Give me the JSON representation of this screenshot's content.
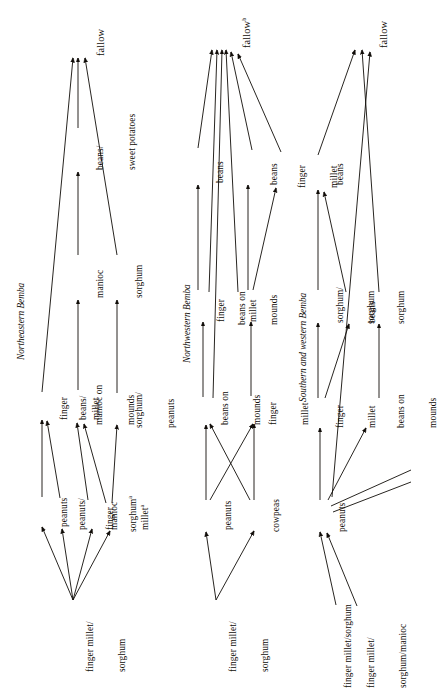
{
  "figure": {
    "type": "diagram",
    "orientation": "text rotated 90 degrees counter-clockwise",
    "background_color": "#ffffff",
    "ink_color": "#100c08"
  },
  "sections": [
    {
      "id": "northeastern",
      "title": "Northeastern Bemba",
      "nodes": [
        {
          "id": "ne-src",
          "label": "finger millet/\nsorghum"
        },
        {
          "id": "ne-peanuts",
          "label": "peanuts"
        },
        {
          "id": "ne-pean-man",
          "label": "peanuts/\nmanioc"
        },
        {
          "id": "ne-fm-a",
          "label": "finger\nmillet",
          "note": "a"
        },
        {
          "id": "ne-sorg-a",
          "label": "sorghum",
          "note": "a"
        },
        {
          "id": "ne-fmillet",
          "label": "finger\nmillet"
        },
        {
          "id": "ne-beans",
          "label": "beans/"
        },
        {
          "id": "ne-manioc-m",
          "label": "manioc on\nmounds"
        },
        {
          "id": "ne-sorg-pean",
          "label": "sorghum/\npeanuts"
        },
        {
          "id": "ne-manioc",
          "label": "manioc"
        },
        {
          "id": "ne-sorghum",
          "label": "sorghum"
        },
        {
          "id": "ne-beans-sp",
          "label": "beans/\nsweet potatoes"
        },
        {
          "id": "ne-fallow",
          "label": "fallow"
        }
      ],
      "edges": [
        [
          "ne-src",
          "ne-peanuts"
        ],
        [
          "ne-src",
          "ne-pean-man"
        ],
        [
          "ne-src",
          "ne-fm-a"
        ],
        [
          "ne-src",
          "ne-sorg-a"
        ],
        [
          "ne-peanuts",
          "ne-fmillet"
        ],
        [
          "ne-pean-man",
          "ne-fmillet"
        ],
        [
          "ne-fm-a",
          "ne-manioc-m"
        ],
        [
          "ne-sorg-a",
          "ne-manioc-m"
        ],
        [
          "ne-sorg-a",
          "ne-sorg-pean"
        ],
        [
          "ne-manioc-m",
          "ne-manioc"
        ],
        [
          "ne-sorg-pean",
          "ne-sorghum"
        ],
        [
          "ne-manioc",
          "ne-beans-sp"
        ],
        [
          "ne-fmillet",
          "ne-fallow"
        ],
        [
          "ne-beans-sp",
          "ne-fallow"
        ],
        [
          "ne-sorghum",
          "ne-fallow"
        ]
      ]
    },
    {
      "id": "northwestern",
      "title": "Northwestern Bemba",
      "nodes": [
        {
          "id": "nw-src",
          "label": "finger millet/\nsorghum"
        },
        {
          "id": "nw-peanuts",
          "label": "peanuts"
        },
        {
          "id": "nw-cowpeas",
          "label": "cowpeas"
        },
        {
          "id": "nw-bom1",
          "label": "beans on\nmounds"
        },
        {
          "id": "nw-fm1",
          "label": "finger\nmillet"
        },
        {
          "id": "nw-fm2",
          "label": "finger\nmillet"
        },
        {
          "id": "nw-bom2",
          "label": "beans on\nmounds"
        },
        {
          "id": "nw-beans1",
          "label": "beans"
        },
        {
          "id": "nw-beans2",
          "label": "beans"
        },
        {
          "id": "nw-fm3",
          "label": "finger\nmillet"
        },
        {
          "id": "nw-fallow",
          "label": "fallow",
          "note": "b"
        }
      ],
      "edges": [
        [
          "nw-src",
          "nw-peanuts"
        ],
        [
          "nw-src",
          "nw-cowpeas"
        ],
        [
          "nw-peanuts",
          "nw-bom1"
        ],
        [
          "nw-peanuts",
          "nw-fm1"
        ],
        [
          "nw-cowpeas",
          "nw-bom1"
        ],
        [
          "nw-cowpeas",
          "nw-fm1"
        ],
        [
          "nw-bom1",
          "nw-fm2"
        ],
        [
          "nw-fm1",
          "nw-bom2"
        ],
        [
          "nw-fm2",
          "nw-beans1"
        ],
        [
          "nw-bom2",
          "nw-beans2"
        ],
        [
          "nw-bom2",
          "nw-fm3"
        ],
        [
          "nw-beans1",
          "nw-fallow"
        ],
        [
          "nw-beans2",
          "nw-fallow"
        ],
        [
          "nw-fm3",
          "nw-fallow"
        ],
        [
          "nw-fm2",
          "nw-fallow"
        ],
        [
          "nw-bom1",
          "nw-fallow"
        ],
        [
          "nw-bom2",
          "nw-fallow"
        ]
      ]
    },
    {
      "id": "southern-western",
      "title": "Southern and western Bemba",
      "nodes": [
        {
          "id": "sw-src1",
          "label": "finger millet/sorghum"
        },
        {
          "id": "sw-src2",
          "label": "finger millet/\nsorghum/manioc"
        },
        {
          "id": "sw-peanuts",
          "label": "peanuts"
        },
        {
          "id": "sw-fmillet",
          "label": "finger\nmillet"
        },
        {
          "id": "sw-bom",
          "label": "beans on\nmounds"
        },
        {
          "id": "sw-sorgbeans",
          "label": "sorghum/\nbeans"
        },
        {
          "id": "sw-sorg1",
          "label": "sorghum"
        },
        {
          "id": "sw-sorg2",
          "label": "sorghum"
        },
        {
          "id": "sw-beans",
          "label": "beans"
        },
        {
          "id": "sw-fallow",
          "label": "fallow"
        }
      ],
      "edges": [
        [
          "sw-src1",
          "sw-peanuts"
        ],
        [
          "sw-src2",
          "sw-peanuts"
        ],
        [
          "sw-peanuts",
          "sw-fmillet"
        ],
        [
          "sw-peanuts",
          "sw-bom"
        ],
        [
          "sw-fmillet",
          "sw-sorgbeans"
        ],
        [
          "sw-fmillet",
          "sw-sorg1"
        ],
        [
          "sw-bom",
          "sw-sorg2"
        ],
        [
          "sw-sorgbeans",
          "sw-beans"
        ],
        [
          "sw-sorg1",
          "sw-beans"
        ],
        [
          "sw-beans",
          "sw-fallow"
        ],
        [
          "sw-sorg2",
          "sw-fallow"
        ],
        [
          "sw-peanuts",
          "sw-fallow"
        ]
      ]
    }
  ]
}
